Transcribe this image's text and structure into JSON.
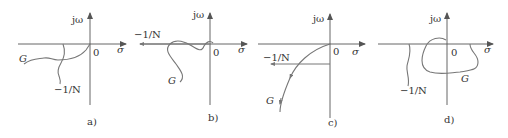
{
  "figure": {
    "panels": [
      {
        "id": "a",
        "caption": "a)",
        "axis_v": "jω",
        "axis_h": "σ",
        "origin": "0",
        "curve_g": "G",
        "curve_n": "−1/N"
      },
      {
        "id": "b",
        "caption": "b)",
        "axis_v": "jω",
        "axis_h": "σ",
        "origin": "0",
        "curve_g": "G",
        "curve_n": "−1/N"
      },
      {
        "id": "c",
        "caption": "c)",
        "axis_v": "jω",
        "axis_h": "σ",
        "origin": "0",
        "curve_g": "G",
        "curve_n": "−1/N"
      },
      {
        "id": "d",
        "caption": "d)",
        "axis_v": "jω",
        "axis_h": "σ",
        "origin": "0",
        "curve_g": "G",
        "curve_n": "−1/N"
      }
    ],
    "colors": {
      "axis": "#555555",
      "curve": "#777777",
      "text": "#333333"
    }
  }
}
